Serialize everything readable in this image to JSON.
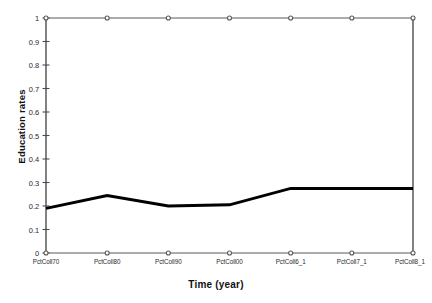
{
  "chart_data": {
    "type": "line",
    "title": "",
    "xlabel": "Time (year)",
    "ylabel": "Education rates",
    "categories": [
      "PctColl70",
      "PctColl80",
      "PctColl90",
      "PctColl00",
      "PctColl6_1",
      "PctColl7_1",
      "PctColl8_1"
    ],
    "ylim": [
      0,
      1
    ],
    "y_ticks": [
      "0",
      "0.1",
      "0.2",
      "0.3",
      "0.4",
      "0.5",
      "0.6",
      "0.7",
      "0.8",
      "0.9",
      "1"
    ],
    "y_tick_values": [
      0,
      0.1,
      0.2,
      0.3,
      0.4,
      0.5,
      0.6,
      0.7,
      0.8,
      0.9,
      1
    ],
    "grid": false,
    "legend": "none",
    "series": [
      {
        "name": "Education rates",
        "values": [
          0.19,
          0.245,
          0.2,
          0.205,
          0.275,
          0.275,
          0.275
        ],
        "color": "#000000",
        "line_width": 3,
        "marker": "none"
      },
      {
        "name": "Upper reference",
        "values": [
          1,
          1,
          1,
          1,
          1,
          1,
          1
        ],
        "color": "#595959",
        "line_width": 1,
        "marker": "circle"
      },
      {
        "name": "Lower reference",
        "values": [
          0,
          0,
          0,
          0,
          0,
          0,
          0
        ],
        "color": "#595959",
        "line_width": 1,
        "marker": "circle"
      }
    ]
  },
  "axes": {
    "y_axis_color": "#4d4d4d",
    "right_spine_color": "#4d4d4d"
  }
}
